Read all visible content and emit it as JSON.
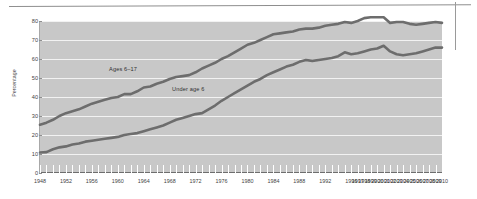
{
  "figure": {
    "y_axis_title": "Percentage",
    "series_labels": {
      "older": "Ages 6–17",
      "younger": "Under age 6"
    }
  },
  "chart_data": {
    "type": "line",
    "title": "",
    "subtitle": "",
    "xlabel": "",
    "ylabel": "Percentage",
    "ylim": [
      0,
      80
    ],
    "yticks": [
      0,
      10,
      20,
      30,
      40,
      50,
      60,
      70,
      80
    ],
    "grid": true,
    "legend_position": "inline-annotation",
    "annotations": [
      "Ages 6–17",
      "Under age 6"
    ],
    "xtick_labels": [
      "1948",
      "1952",
      "1956",
      "1960",
      "1964",
      "1968",
      "1972",
      "1976",
      "1980",
      "1984",
      "1988",
      "1992",
      "1996",
      "1997",
      "1998",
      "1999",
      "2000",
      "2001",
      "2002",
      "2003",
      "2004",
      "2005",
      "2006",
      "2007",
      "2008",
      "2009",
      "2010"
    ],
    "x": [
      1948,
      1949,
      1950,
      1951,
      1952,
      1953,
      1954,
      1955,
      1956,
      1957,
      1958,
      1959,
      1960,
      1961,
      1962,
      1963,
      1964,
      1965,
      1966,
      1967,
      1968,
      1969,
      1970,
      1971,
      1972,
      1973,
      1974,
      1975,
      1976,
      1977,
      1978,
      1979,
      1980,
      1981,
      1982,
      1983,
      1984,
      1985,
      1986,
      1987,
      1988,
      1989,
      1990,
      1991,
      1992,
      1993,
      1994,
      1995,
      1996,
      1997,
      1998,
      1999,
      2000,
      2001,
      2002,
      2003,
      2004,
      2005,
      2006,
      2007,
      2008,
      2009,
      2010
    ],
    "series": [
      {
        "name": "Ages 6–17",
        "color": "#6d6d6d",
        "values": [
          25.4,
          26.5,
          28.0,
          30.0,
          31.5,
          32.5,
          33.5,
          35.0,
          36.5,
          37.5,
          38.5,
          39.5,
          40.0,
          41.5,
          41.5,
          43.0,
          45.0,
          45.5,
          47.0,
          48.0,
          49.5,
          50.5,
          51.0,
          51.5,
          53.0,
          55.0,
          56.5,
          58.0,
          60.0,
          61.5,
          63.5,
          65.5,
          67.5,
          68.5,
          70.0,
          71.5,
          73.0,
          73.5,
          74.0,
          74.5,
          75.5,
          76.0,
          76.0,
          76.5,
          77.5,
          78.0,
          78.5,
          79.5,
          79.0,
          80.0,
          81.5,
          82.0,
          82.0,
          82.0,
          79.0,
          79.5,
          79.5,
          78.5,
          78.0,
          78.5,
          79.0,
          79.5,
          79.0
        ]
      },
      {
        "name": "Under age 6",
        "color": "#6d6d6d",
        "values": [
          10.8,
          11.0,
          12.5,
          13.5,
          14.0,
          15.0,
          15.5,
          16.5,
          17.0,
          17.5,
          18.0,
          18.5,
          19.0,
          20.0,
          20.5,
          21.0,
          22.0,
          23.0,
          24.0,
          25.0,
          26.5,
          28.0,
          29.0,
          30.0,
          31.0,
          31.5,
          33.5,
          35.5,
          38.0,
          40.0,
          42.0,
          44.0,
          46.0,
          48.0,
          49.5,
          51.5,
          53.0,
          54.5,
          56.0,
          57.0,
          58.5,
          59.5,
          59.0,
          59.5,
          60.0,
          60.5,
          61.5,
          63.5,
          62.5,
          63.0,
          64.0,
          65.0,
          65.5,
          67.0,
          64.0,
          62.5,
          62.0,
          62.5,
          63.0,
          64.0,
          65.0,
          66.0,
          66.0
        ]
      }
    ]
  }
}
